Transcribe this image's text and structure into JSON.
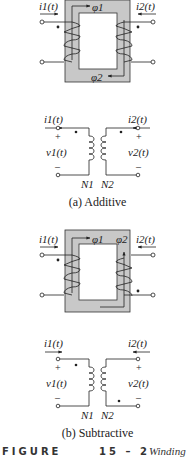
{
  "figure": {
    "number_label": "FIGURE",
    "number": "15 – 2",
    "title_fragment": "Winding"
  },
  "panel_a": {
    "caption": "(a) Additive",
    "core": {
      "flux_1": "φ1",
      "flux_2": "φ2",
      "current_left": "i1(t)",
      "current_right": "i2(t)"
    },
    "schematic": {
      "current_left": "i1(t)",
      "current_right": "i2(t)",
      "voltage_left": "v1(t)",
      "voltage_right": "v2(t)",
      "plus_left": "+",
      "minus_left": "–",
      "plus_right": "+",
      "minus_right": "–",
      "turns_left": "N1",
      "turns_right": "N2",
      "dot_left": "top",
      "dot_right": "top"
    }
  },
  "panel_b": {
    "caption": "(b) Subtractive",
    "core": {
      "flux_1": "φ1",
      "flux_2": "φ2",
      "current_left": "i1(t)",
      "current_right": "i2(t)"
    },
    "schematic": {
      "current_left": "i1(t)",
      "current_right": "i2(t)",
      "voltage_left": "v1(t)",
      "voltage_right": "v2(t)",
      "plus_left": "+",
      "minus_left": "–",
      "plus_right": "+",
      "minus_right": "–",
      "turns_left": "N1",
      "turns_right": "N2",
      "dot_left": "top",
      "dot_right": "bottom"
    }
  },
  "colors": {
    "core_fill": "#c8c8c8",
    "line": "#222222",
    "background": "#ffffff"
  }
}
